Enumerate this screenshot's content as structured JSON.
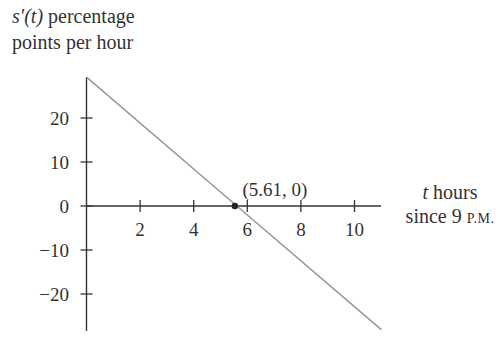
{
  "chart_data": {
    "type": "line",
    "title": "",
    "ylabel_func": "s′(t)",
    "ylabel_rest": "percentage",
    "ylabel_line2": "points per hour",
    "xlabel_var": "t",
    "xlabel_rest": "hours",
    "xlabel_line2_prefix": "since 9 ",
    "xlabel_line2_sc": "P.M.",
    "x_ticks": [
      2,
      4,
      6,
      8,
      10
    ],
    "x_tick_labels": [
      "2",
      "4",
      "6",
      "8",
      "10"
    ],
    "y_ticks": [
      20,
      10,
      0,
      -10,
      -20
    ],
    "y_tick_labels": [
      "20",
      "10",
      "0",
      "−10",
      "−20"
    ],
    "xlim": [
      0,
      11
    ],
    "ylim": [
      -28,
      29.3
    ],
    "series": [
      {
        "name": "s'(t)",
        "x": [
          0,
          5.61,
          11
        ],
        "values": [
          29.3,
          0,
          -28.1
        ],
        "color": "#999999"
      }
    ],
    "annotations": [
      {
        "x": 5.61,
        "y": 0,
        "label": "(5.61, 0)",
        "marker": "dot"
      }
    ],
    "grid": false,
    "legend": "none"
  }
}
